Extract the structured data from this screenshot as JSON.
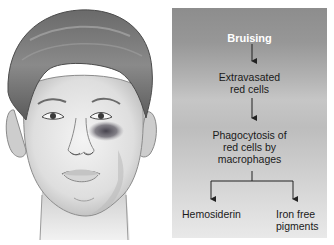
{
  "figure": {
    "left_panel": {
      "subject": "Illustration of a young man's face with a bruise (black eye) below the left eye",
      "bruise_color": "#3d3a45"
    },
    "flowchart": {
      "nodes": {
        "root": "Bruising",
        "step1_line1": "Extravasated",
        "step1_line2": "red cells",
        "step2_line1": "Phagocytosis of",
        "step2_line2": "red cells by",
        "step2_line3": "macrophages",
        "leaf_left": "Hemosiderin",
        "leaf_right_line1": "Iron free",
        "leaf_right_line2": "pigments"
      },
      "colors": {
        "panel_top": "#8d8d8d",
        "panel_bottom": "#e9e9e9",
        "root_text": "#ffffff",
        "text": "#1a1a1a",
        "arrow": "#222222"
      }
    }
  }
}
